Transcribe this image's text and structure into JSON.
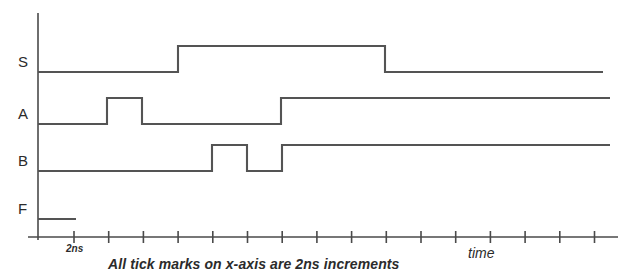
{
  "figure": {
    "caption": "All tick marks on x-axis are 2ns increments",
    "axis_time_label": "time",
    "tick_unit_label": "2ns"
  },
  "signals": [
    {
      "name": "S",
      "label": "S"
    },
    {
      "name": "A",
      "label": "A"
    },
    {
      "name": "B",
      "label": "B"
    },
    {
      "name": "F",
      "label": "F"
    }
  ],
  "colors": {
    "waveform": "#545454",
    "axis": "#4a4a4a",
    "text": "#2b2b2b",
    "background": "#ffffff"
  },
  "chart_data": {
    "type": "line",
    "title": "",
    "subtitle": "",
    "xlabel": "time",
    "ylabel": "",
    "annotations": [
      "All tick marks on x-axis are 2ns increments",
      "2ns"
    ],
    "grid": false,
    "legend": "none",
    "x_tick_increment_ns": 2,
    "x_tick_count": 16,
    "x_tick_labels": [
      "2ns"
    ],
    "x_tick_positions_px": [
      74,
      108.7,
      143.4,
      178.1,
      212.8,
      247.5,
      282.2,
      316.9,
      351.6,
      386.3,
      421,
      455.7,
      490.4,
      525.1,
      559.8,
      594.5
    ],
    "xlim_px": [
      28,
      618
    ],
    "ylim_px": [
      13,
      240
    ],
    "axis_origin_px": {
      "x": 38,
      "y": 237
    },
    "level_offset_px": 26,
    "series": [
      {
        "name": "S",
        "baseline_px": 72,
        "start_px": 38,
        "end_px": 603,
        "description": "Low from 0ns; rises at tick 4 (6ns); falls at x=385 (about 18ns); low thereafter",
        "transitions": [
          {
            "x_px": 178,
            "level": 1
          },
          {
            "x_px": 385,
            "level": 0
          }
        ],
        "initial_level": 0
      },
      {
        "name": "A",
        "baseline_px": 124,
        "start_px": 38,
        "end_px": 610,
        "description": "Low; pulse high from tick 1 (2ns) to tick 2 (4ns); low until tick 7 (14ns); high thereafter",
        "transitions": [
          {
            "x_px": 107,
            "level": 1
          },
          {
            "x_px": 142,
            "level": 0
          },
          {
            "x_px": 281,
            "level": 1
          }
        ],
        "initial_level": 0
      },
      {
        "name": "B",
        "baseline_px": 171,
        "start_px": 38,
        "end_px": 610,
        "description": "Low until tick 5 (8ns); high to tick 6 (10ns); low to tick 7 (12ns); high thereafter",
        "transitions": [
          {
            "x_px": 212,
            "level": 1
          },
          {
            "x_px": 247,
            "level": 0
          },
          {
            "x_px": 282,
            "level": 1
          }
        ],
        "initial_level": 0
      },
      {
        "name": "F",
        "baseline_px": 219,
        "start_px": 38,
        "end_px": 76,
        "description": "Short low segment from 0ns to tick 1 (2ns), then trace ends",
        "transitions": [],
        "initial_level": 0
      }
    ]
  }
}
